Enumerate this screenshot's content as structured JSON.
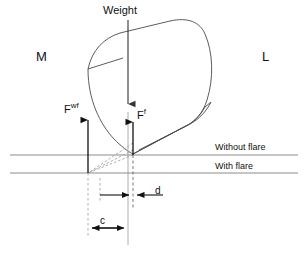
{
  "figure": {
    "title_label": "Weight",
    "side_labels": {
      "left": "M",
      "right": "L"
    },
    "force_labels": {
      "without_flare_base": "F",
      "without_flare_sup": "wf",
      "with_flare_base": "F",
      "with_flare_sup": "f"
    },
    "reference_lines": [
      {
        "id": "without-flare",
        "label": "Without flare",
        "y": 155
      },
      {
        "id": "with-flare",
        "label": "With flare",
        "y": 173
      }
    ],
    "dimensions": [
      {
        "id": "d",
        "label": "d"
      },
      {
        "id": "c",
        "label": "c"
      }
    ],
    "colors": {
      "stroke": "#4a4a4a",
      "stroke_dark": "#111111",
      "reference_line": "#8c8c8c",
      "dashed": "#9a9a9a",
      "background": "#ffffff"
    }
  }
}
